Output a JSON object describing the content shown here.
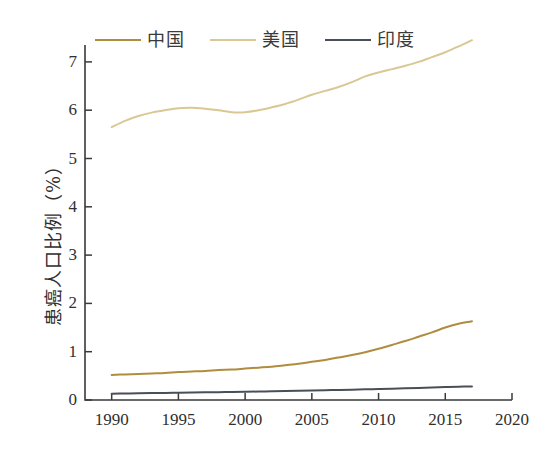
{
  "chart_data": {
    "type": "line",
    "title": "",
    "xlabel": "",
    "ylabel": "患癌人口比例（%）",
    "xlim": [
      1988,
      2020
    ],
    "ylim": [
      0,
      7.35
    ],
    "xticks": [
      "1990",
      "1995",
      "2000",
      "2005",
      "2010",
      "2015",
      "2020"
    ],
    "xtick_values": [
      1990,
      1995,
      2000,
      2005,
      2010,
      2015,
      2020
    ],
    "yticks": [
      "0",
      "1",
      "2",
      "3",
      "4",
      "5",
      "6",
      "7"
    ],
    "ytick_values": [
      0,
      1,
      2,
      3,
      4,
      5,
      6,
      7
    ],
    "grid": false,
    "legend_position": "top",
    "x": [
      1990,
      1991,
      1992,
      1993,
      1994,
      1995,
      1996,
      1997,
      1998,
      1999,
      2000,
      2001,
      2002,
      2003,
      2004,
      2005,
      2006,
      2007,
      2008,
      2009,
      2010,
      2011,
      2012,
      2013,
      2014,
      2015,
      2016,
      2017
    ],
    "series": [
      {
        "name": "中国",
        "color": "#b08c3f",
        "values": [
          0.52,
          0.53,
          0.54,
          0.55,
          0.56,
          0.58,
          0.59,
          0.6,
          0.62,
          0.63,
          0.65,
          0.67,
          0.69,
          0.72,
          0.75,
          0.79,
          0.83,
          0.88,
          0.93,
          0.99,
          1.06,
          1.14,
          1.22,
          1.31,
          1.4,
          1.5,
          1.58,
          1.63
        ]
      },
      {
        "name": "美国",
        "color": "#d9c894",
        "values": [
          5.65,
          5.78,
          5.88,
          5.95,
          6.0,
          6.04,
          6.05,
          6.03,
          6.0,
          5.96,
          5.96,
          6.0,
          6.06,
          6.13,
          6.22,
          6.32,
          6.4,
          6.48,
          6.58,
          6.7,
          6.78,
          6.85,
          6.92,
          7.0,
          7.1,
          7.2,
          7.32,
          7.45
        ]
      },
      {
        "name": "印度",
        "color": "#4a4f57",
        "values": [
          0.13,
          0.135,
          0.14,
          0.143,
          0.147,
          0.15,
          0.154,
          0.158,
          0.162,
          0.166,
          0.17,
          0.175,
          0.18,
          0.185,
          0.19,
          0.196,
          0.202,
          0.208,
          0.214,
          0.221,
          0.228,
          0.235,
          0.243,
          0.251,
          0.26,
          0.268,
          0.275,
          0.28
        ]
      }
    ]
  },
  "axis": {
    "line_color": "#3a3a3a"
  }
}
